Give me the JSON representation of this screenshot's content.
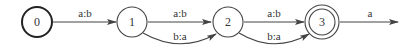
{
  "diagram": {
    "type": "finite-state-transducer",
    "colors": {
      "stroke": "#444444",
      "text": "#333333",
      "background": "#ffffff"
    },
    "states": [
      {
        "id": "0",
        "label": "0",
        "initial": true,
        "final": false
      },
      {
        "id": "1",
        "label": "1",
        "initial": false,
        "final": false
      },
      {
        "id": "2",
        "label": "2",
        "initial": false,
        "final": false
      },
      {
        "id": "3",
        "label": "3",
        "initial": false,
        "final": true
      }
    ],
    "transitions": [
      {
        "from": "0",
        "to": "1",
        "label": "a:b"
      },
      {
        "from": "1",
        "to": "2",
        "label": "a:b"
      },
      {
        "from": "1",
        "to": "2",
        "label": "b:a"
      },
      {
        "from": "2",
        "to": "3",
        "label": "a:b"
      },
      {
        "from": "2",
        "to": "3",
        "label": "b:a"
      },
      {
        "from": "3",
        "to": null,
        "label": "a"
      }
    ]
  }
}
